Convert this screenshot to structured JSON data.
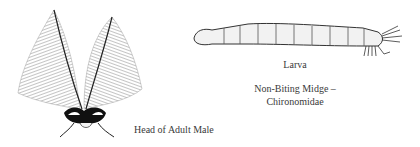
{
  "figures": {
    "head": {
      "icon": "midge-head-plumose-antennae",
      "caption": "Head of Adult Male"
    },
    "larva": {
      "icon": "midge-larva",
      "caption": "Larva"
    }
  },
  "title": {
    "line1": "Non-Biting Midge –",
    "line2": "Chironomidae"
  }
}
